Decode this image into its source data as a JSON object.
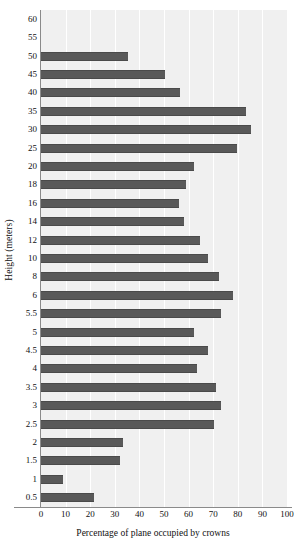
{
  "chart_data": {
    "type": "bar",
    "orientation": "horizontal",
    "title": "",
    "xlabel": "Percentage of plane occupied by crowns",
    "ylabel": "Height (meters)",
    "xlim": [
      0,
      100
    ],
    "xticks": [
      0,
      10,
      20,
      30,
      40,
      50,
      60,
      70,
      80,
      90,
      100
    ],
    "grid": "vertical-white",
    "legend": "none",
    "bar_color": "#595959",
    "plot_background": "#f0f0f0",
    "categories": [
      "60",
      "55",
      "50",
      "45",
      "40",
      "35",
      "30",
      "25",
      "20",
      "18",
      "16",
      "14",
      "12",
      "10",
      "8",
      "6",
      "5.5",
      "5",
      "4.5",
      "4",
      "3.5",
      "3",
      "2.5",
      "2",
      "1.5",
      "1",
      "0.5"
    ],
    "values": [
      0,
      0,
      35.5,
      50.5,
      56.5,
      83.5,
      85.5,
      79.5,
      62,
      59,
      56,
      58,
      64.5,
      68,
      72.5,
      78,
      73,
      62,
      68,
      63.5,
      71,
      73,
      70.5,
      33.5,
      32,
      9,
      21.5
    ]
  }
}
